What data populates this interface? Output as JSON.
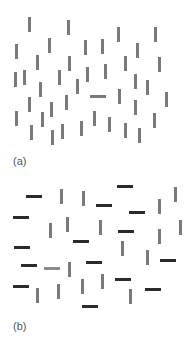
{
  "figure": {
    "colors": {
      "gray_bar": "#7a7a7a",
      "gray_odd_bar": "#8a8a8a",
      "dark_bar": "#2b2b2b",
      "label": "#555555",
      "background": "#ffffff"
    },
    "panels": [
      {
        "id": "a",
        "label": "(a)",
        "label_pos": [
          13,
          155
        ],
        "description": "Search display: many gray vertical bars and one gray horizontal target (pop-out by orientation)",
        "bars": [
          {
            "x": 28,
            "y": 17,
            "o": "v",
            "c": "gray"
          },
          {
            "x": 67,
            "y": 20,
            "o": "v",
            "c": "gray"
          },
          {
            "x": 117,
            "y": 27,
            "o": "v",
            "c": "gray"
          },
          {
            "x": 154,
            "y": 27,
            "o": "v",
            "c": "gray"
          },
          {
            "x": 48,
            "y": 38,
            "o": "v",
            "c": "gray"
          },
          {
            "x": 84,
            "y": 40,
            "o": "v",
            "c": "gray"
          },
          {
            "x": 101,
            "y": 39,
            "o": "v",
            "c": "gray"
          },
          {
            "x": 136,
            "y": 43,
            "o": "v",
            "c": "gray"
          },
          {
            "x": 15,
            "y": 44,
            "o": "v",
            "c": "gray"
          },
          {
            "x": 36,
            "y": 55,
            "o": "v",
            "c": "gray"
          },
          {
            "x": 68,
            "y": 56,
            "o": "v",
            "c": "gray"
          },
          {
            "x": 124,
            "y": 56,
            "o": "v",
            "c": "gray"
          },
          {
            "x": 158,
            "y": 57,
            "o": "v",
            "c": "gray"
          },
          {
            "x": 104,
            "y": 64,
            "o": "v",
            "c": "gray"
          },
          {
            "x": 86,
            "y": 67,
            "o": "v",
            "c": "gray"
          },
          {
            "x": 14,
            "y": 72,
            "o": "v",
            "c": "gray"
          },
          {
            "x": 23,
            "y": 70,
            "o": "v",
            "c": "gray"
          },
          {
            "x": 58,
            "y": 70,
            "o": "v",
            "c": "gray"
          },
          {
            "x": 134,
            "y": 74,
            "o": "v",
            "c": "gray"
          },
          {
            "x": 76,
            "y": 79,
            "o": "v",
            "c": "gray"
          },
          {
            "x": 146,
            "y": 80,
            "o": "v",
            "c": "gray"
          },
          {
            "x": 39,
            "y": 82,
            "o": "v",
            "c": "gray"
          },
          {
            "x": 118,
            "y": 89,
            "o": "v",
            "c": "gray"
          },
          {
            "x": 165,
            "y": 92,
            "o": "v",
            "c": "gray"
          },
          {
            "x": 90,
            "y": 95,
            "o": "h",
            "c": "gray",
            "target": true
          },
          {
            "x": 65,
            "y": 95,
            "o": "v",
            "c": "gray"
          },
          {
            "x": 28,
            "y": 97,
            "o": "v",
            "c": "gray"
          },
          {
            "x": 134,
            "y": 100,
            "o": "v",
            "c": "gray"
          },
          {
            "x": 50,
            "y": 102,
            "o": "v",
            "c": "gray"
          },
          {
            "x": 15,
            "y": 111,
            "o": "v",
            "c": "gray"
          },
          {
            "x": 41,
            "y": 112,
            "o": "v",
            "c": "gray"
          },
          {
            "x": 93,
            "y": 111,
            "o": "v",
            "c": "gray"
          },
          {
            "x": 153,
            "y": 113,
            "o": "v",
            "c": "gray"
          },
          {
            "x": 108,
            "y": 117,
            "o": "v",
            "c": "gray"
          },
          {
            "x": 80,
            "y": 121,
            "o": "v",
            "c": "gray"
          },
          {
            "x": 30,
            "y": 125,
            "o": "v",
            "c": "gray"
          },
          {
            "x": 61,
            "y": 124,
            "o": "v",
            "c": "gray"
          },
          {
            "x": 124,
            "y": 123,
            "o": "v",
            "c": "gray"
          },
          {
            "x": 138,
            "y": 128,
            "o": "v",
            "c": "gray"
          },
          {
            "x": 51,
            "y": 130,
            "o": "v",
            "c": "gray"
          }
        ]
      },
      {
        "id": "b",
        "label": "(b)",
        "label_pos": [
          13,
          320
        ],
        "description": "Conjunction search: gray vertical and dark horizontal distractors with one gray horizontal target",
        "bars": [
          {
            "x": 117,
            "y": 185,
            "o": "h",
            "c": "dark"
          },
          {
            "x": 26,
            "y": 195,
            "o": "h",
            "c": "dark"
          },
          {
            "x": 60,
            "y": 189,
            "o": "v",
            "c": "gray"
          },
          {
            "x": 82,
            "y": 191,
            "o": "v",
            "c": "gray"
          },
          {
            "x": 174,
            "y": 187,
            "o": "v",
            "c": "gray"
          },
          {
            "x": 96,
            "y": 204,
            "o": "h",
            "c": "dark"
          },
          {
            "x": 158,
            "y": 199,
            "o": "v",
            "c": "gray"
          },
          {
            "x": 129,
            "y": 211,
            "o": "h",
            "c": "dark"
          },
          {
            "x": 13,
            "y": 216,
            "o": "h",
            "c": "dark"
          },
          {
            "x": 66,
            "y": 217,
            "o": "v",
            "c": "gray"
          },
          {
            "x": 49,
            "y": 223,
            "o": "v",
            "c": "gray"
          },
          {
            "x": 99,
            "y": 220,
            "o": "v",
            "c": "gray"
          },
          {
            "x": 179,
            "y": 220,
            "o": "v",
            "c": "gray"
          },
          {
            "x": 118,
            "y": 230,
            "o": "h",
            "c": "dark"
          },
          {
            "x": 158,
            "y": 229,
            "o": "v",
            "c": "gray"
          },
          {
            "x": 73,
            "y": 240,
            "o": "h",
            "c": "dark"
          },
          {
            "x": 121,
            "y": 241,
            "o": "v",
            "c": "gray"
          },
          {
            "x": 14,
            "y": 246,
            "o": "h",
            "c": "dark"
          },
          {
            "x": 146,
            "y": 250,
            "o": "v",
            "c": "gray"
          },
          {
            "x": 160,
            "y": 259,
            "o": "h",
            "c": "dark"
          },
          {
            "x": 86,
            "y": 261,
            "o": "h",
            "c": "dark"
          },
          {
            "x": 21,
            "y": 264,
            "o": "h",
            "c": "dark"
          },
          {
            "x": 44,
            "y": 267,
            "o": "h",
            "c": "grayodd",
            "target": true
          },
          {
            "x": 68,
            "y": 262,
            "o": "v",
            "c": "gray"
          },
          {
            "x": 101,
            "y": 274,
            "o": "v",
            "c": "gray"
          },
          {
            "x": 115,
            "y": 278,
            "o": "h",
            "c": "dark"
          },
          {
            "x": 81,
            "y": 279,
            "o": "v",
            "c": "gray"
          },
          {
            "x": 13,
            "y": 285,
            "o": "h",
            "c": "dark"
          },
          {
            "x": 57,
            "y": 284,
            "o": "v",
            "c": "gray"
          },
          {
            "x": 145,
            "y": 288,
            "o": "h",
            "c": "dark"
          },
          {
            "x": 36,
            "y": 288,
            "o": "v",
            "c": "gray"
          },
          {
            "x": 129,
            "y": 289,
            "o": "v",
            "c": "gray"
          },
          {
            "x": 82,
            "y": 305,
            "o": "h",
            "c": "dark"
          }
        ]
      }
    ]
  }
}
